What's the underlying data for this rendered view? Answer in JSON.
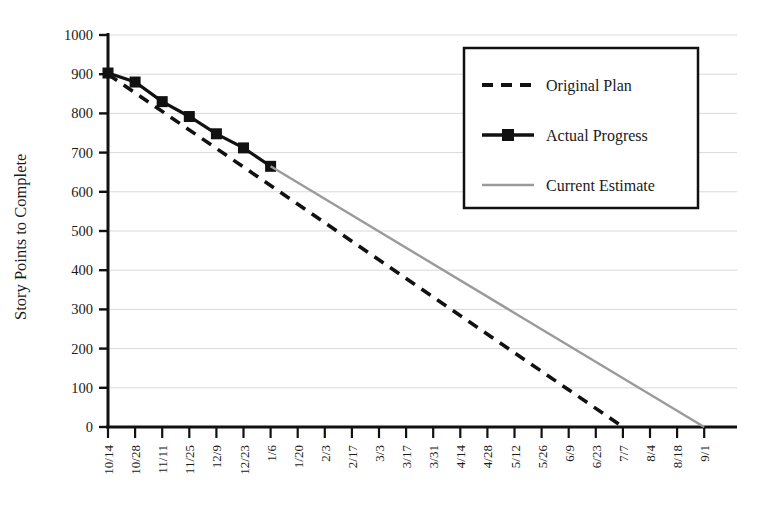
{
  "chart_data": {
    "type": "line",
    "title": "",
    "xlabel": "",
    "ylabel": "Story Points to Complete",
    "ylim": [
      0,
      1000
    ],
    "ytick_values": [
      0,
      100,
      200,
      300,
      400,
      500,
      600,
      700,
      800,
      900,
      1000
    ],
    "ytick_labels": [
      "0",
      "100",
      "200",
      "300",
      "400",
      "500",
      "600",
      "700",
      "800",
      "900",
      "1000"
    ],
    "grid": "horizontal",
    "legend_position": "top-right",
    "categories": [
      "10/14",
      "10/28",
      "11/11",
      "11/25",
      "12/9",
      "12/23",
      "1/6",
      "1/20",
      "2/3",
      "2/17",
      "3/3",
      "3/17",
      "3/31",
      "4/14",
      "4/28",
      "5/12",
      "5/26",
      "6/9",
      "6/23",
      "7/7",
      "8/4",
      "8/18",
      "9/1"
    ],
    "series": [
      {
        "name": "Original Plan",
        "style": "dashed",
        "color": "#111111",
        "x": [
          "10/14",
          "7/7"
        ],
        "values": [
          900,
          0
        ]
      },
      {
        "name": "Actual Progress",
        "style": "solid-marker",
        "color": "#111111",
        "marker": "square",
        "x": [
          "10/14",
          "10/28",
          "11/11",
          "11/25",
          "12/9",
          "12/23",
          "1/6"
        ],
        "values": [
          903,
          880,
          830,
          792,
          748,
          712,
          665
        ]
      },
      {
        "name": "Current Estimate",
        "style": "solid",
        "color": "#9a9a9a",
        "x": [
          "1/6",
          "9/1"
        ],
        "values": [
          665,
          0
        ]
      }
    ]
  },
  "legend": {
    "items": [
      {
        "label": "Original Plan",
        "swatch": "dashed-line-swatch"
      },
      {
        "label": "Actual Progress",
        "swatch": "marker-line-swatch"
      },
      {
        "label": "Current Estimate",
        "swatch": "gray-line-swatch"
      }
    ]
  },
  "colors": {
    "axis": "#111111",
    "grid": "#d9d9d9",
    "plan": "#111111",
    "actual": "#111111",
    "estimate": "#9a9a9a",
    "background": "#ffffff"
  }
}
